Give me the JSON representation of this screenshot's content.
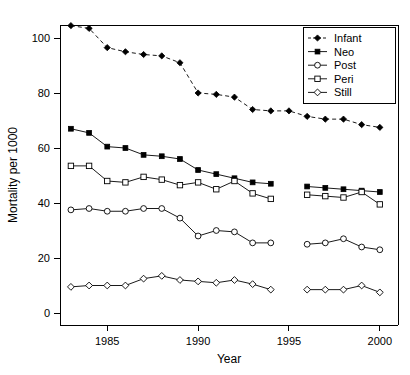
{
  "chart_data": {
    "type": "line",
    "title": "",
    "xlabel": "Year",
    "ylabel": "Mortality per 1000",
    "xlim": [
      1982.4,
      2001.0
    ],
    "ylim": [
      0,
      110
    ],
    "xticks": [
      1985,
      1990,
      1995,
      2000
    ],
    "yticks": [
      0,
      20,
      40,
      60,
      80,
      100
    ],
    "grid": false,
    "legend_position": "top-right",
    "legend_entries": [
      "Infant",
      "Neo",
      "Post",
      "Peri",
      "Still"
    ],
    "series": [
      {
        "name": "Infant",
        "marker": "filled-diamond",
        "linestyle": "dashed",
        "x": [
          1983,
          1984,
          1985,
          1986,
          1987,
          1988,
          1989,
          1990,
          1991,
          1992,
          1993,
          1994,
          1995,
          1996,
          1997,
          1998,
          1999,
          2000
        ],
        "values": [
          104.5,
          103.5,
          96.5,
          95.0,
          94.0,
          93.5,
          91.0,
          80.0,
          79.5,
          78.5,
          74.0,
          73.5,
          73.5,
          71.5,
          70.5,
          70.5,
          68.5,
          67.5
        ]
      },
      {
        "name": "Neo",
        "marker": "filled-square",
        "linestyle": "solid",
        "x": [
          1983,
          1984,
          1985,
          1986,
          1987,
          1988,
          1989,
          1990,
          1991,
          1992,
          1993,
          1994
        ],
        "values": [
          67.0,
          65.5,
          60.5,
          60.0,
          57.5,
          57.0,
          56.0,
          52.0,
          50.5,
          49.0,
          47.5,
          47.0
        ]
      },
      {
        "name": "Neo",
        "marker": "filled-square",
        "linestyle": "solid",
        "x": [
          1996,
          1997,
          1998,
          1999,
          2000
        ],
        "values": [
          46.0,
          45.5,
          45.0,
          44.5,
          44.0
        ]
      },
      {
        "name": "Peri",
        "marker": "open-square",
        "linestyle": "solid",
        "x": [
          1983,
          1984,
          1985,
          1986,
          1987,
          1988,
          1989,
          1990,
          1991,
          1992,
          1993,
          1994
        ],
        "values": [
          53.5,
          53.5,
          48.0,
          47.5,
          49.5,
          48.5,
          46.5,
          47.5,
          45.0,
          48.0,
          43.5,
          41.5
        ]
      },
      {
        "name": "Peri",
        "marker": "open-square",
        "linestyle": "solid",
        "x": [
          1996,
          1997,
          1998,
          1999,
          2000
        ],
        "values": [
          43.0,
          42.5,
          42.0,
          44.0,
          39.5
        ]
      },
      {
        "name": "Post",
        "marker": "open-circle",
        "linestyle": "solid",
        "x": [
          1983,
          1984,
          1985,
          1986,
          1987,
          1988,
          1989,
          1990,
          1991,
          1992,
          1993,
          1994
        ],
        "values": [
          37.5,
          38.0,
          37.0,
          37.0,
          38.0,
          38.0,
          34.5,
          28.0,
          30.0,
          29.5,
          25.5,
          25.5
        ]
      },
      {
        "name": "Post",
        "marker": "open-circle",
        "linestyle": "solid",
        "x": [
          1996,
          1997,
          1998,
          1999,
          2000
        ],
        "values": [
          25.0,
          25.5,
          27.0,
          24.0,
          23.0
        ]
      },
      {
        "name": "Still",
        "marker": "open-diamond",
        "linestyle": "solid",
        "x": [
          1983,
          1984,
          1985,
          1986,
          1987,
          1988,
          1989,
          1990,
          1991,
          1992,
          1993,
          1994
        ],
        "values": [
          9.5,
          10.0,
          10.0,
          10.0,
          12.5,
          13.5,
          12.0,
          11.5,
          11.0,
          12.0,
          10.5,
          8.5
        ]
      },
      {
        "name": "Still",
        "marker": "open-diamond",
        "linestyle": "solid",
        "x": [
          1996,
          1997,
          1998,
          1999,
          2000
        ],
        "values": [
          8.5,
          8.5,
          8.5,
          10.0,
          7.5
        ]
      }
    ]
  },
  "axes": {
    "x_title": "Year",
    "y_title": "Mortality per 1000",
    "x_tick_labels": [
      "1985",
      "1990",
      "1995",
      "2000"
    ],
    "y_tick_labels": [
      "0",
      "20",
      "40",
      "60",
      "80",
      "100"
    ]
  },
  "legend": {
    "items": [
      {
        "label": "Infant",
        "marker": "filled-diamond",
        "line": "dashed"
      },
      {
        "label": "Neo",
        "marker": "filled-square",
        "line": "solid"
      },
      {
        "label": "Post",
        "marker": "open-circle",
        "line": "solid"
      },
      {
        "label": "Peri",
        "marker": "open-square",
        "line": "solid"
      },
      {
        "label": "Still",
        "marker": "open-diamond",
        "line": "solid"
      }
    ]
  },
  "colors": {
    "foreground": "#000000",
    "background": "#ffffff"
  }
}
